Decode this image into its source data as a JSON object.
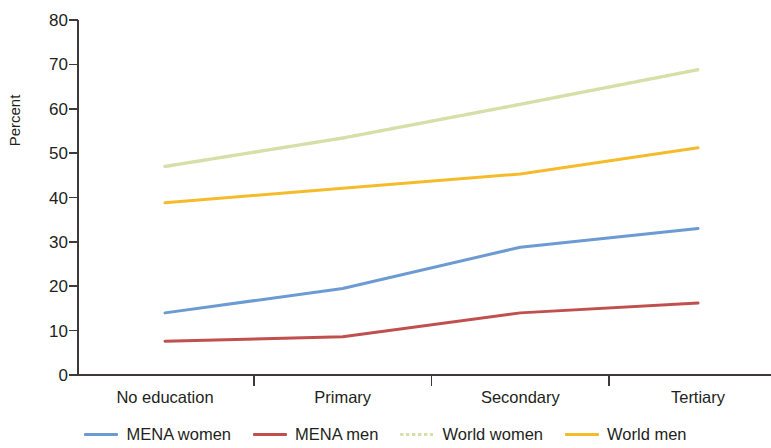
{
  "chart_data": {
    "type": "line",
    "title": "",
    "subtitle": "",
    "xlabel": "",
    "ylabel": "Percent",
    "categories": [
      "No education",
      "Primary",
      "Secondary",
      "Tertiary"
    ],
    "ylim": [
      0,
      80
    ],
    "ytick_step": 10,
    "yticks": [
      0,
      10,
      20,
      30,
      40,
      50,
      60,
      70,
      80
    ],
    "grid": false,
    "legend_position": "bottom",
    "series": [
      {
        "name": "MENA women",
        "color": "#6b9bd2",
        "style": "solid",
        "values": [
          14.0,
          19.5,
          28.8,
          33.0
        ]
      },
      {
        "name": "MENA men",
        "color": "#c0504d",
        "style": "solid",
        "values": [
          7.6,
          8.6,
          14.0,
          16.2
        ]
      },
      {
        "name": "World women",
        "color": "#d6dfa8",
        "style": "dotted",
        "values": [
          47.0,
          53.4,
          61.0,
          68.8
        ]
      },
      {
        "name": "World men",
        "color": "#f5bb2a",
        "style": "solid",
        "values": [
          38.8,
          42.1,
          45.3,
          51.2
        ]
      }
    ]
  },
  "axis": {
    "color": "#3e3a39"
  }
}
